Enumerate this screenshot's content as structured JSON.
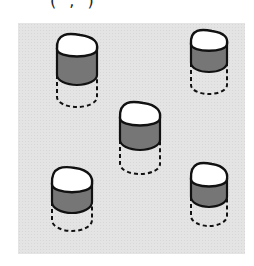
{
  "caption": "(   ,   )",
  "panel": {
    "background": "#e4e4e4",
    "stroke": "#111111",
    "band_color": "#767676",
    "top_color": "#ffffff"
  },
  "cylinders": [
    {
      "id": "cylinder-top-left",
      "x": 57,
      "y": 34,
      "w": 40,
      "top_h": 30,
      "band_h": 26,
      "dash_h": 22
    },
    {
      "id": "cylinder-top-right",
      "x": 191,
      "y": 30,
      "w": 36,
      "top_h": 28,
      "band_h": 19,
      "dash_h": 22
    },
    {
      "id": "cylinder-center",
      "x": 120,
      "y": 102,
      "w": 40,
      "top_h": 32,
      "band_h": 22,
      "dash_h": 24
    },
    {
      "id": "cylinder-bottom-left",
      "x": 52,
      "y": 167,
      "w": 40,
      "top_h": 33,
      "band_h": 18,
      "dash_h": 18
    },
    {
      "id": "cylinder-bottom-right",
      "x": 191,
      "y": 163,
      "w": 36,
      "top_h": 32,
      "band_h": 18,
      "dash_h": 19
    }
  ]
}
